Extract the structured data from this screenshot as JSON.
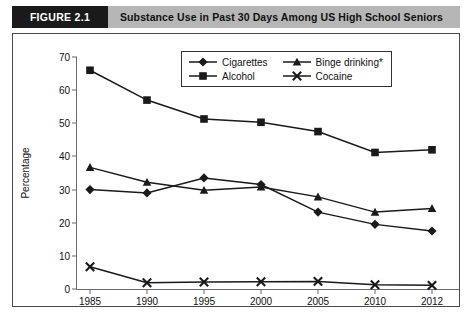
{
  "header": {
    "figure_tag": "FIGURE 2.1",
    "title": "Substance Use in Past 30 Days Among US High School Seniors"
  },
  "chart_data": {
    "type": "line",
    "title": "Substance Use in Past 30 Days Among US High School Seniors",
    "xlabel": "Years",
    "ylabel": "Percentage",
    "categories": [
      "1985",
      "1990",
      "1995",
      "2000",
      "2005",
      "2010",
      "2012"
    ],
    "ylim": [
      0,
      70
    ],
    "yticks": [
      "0",
      "10",
      "20",
      "30",
      "40",
      "50",
      "60",
      "70"
    ],
    "grid": false,
    "legend_position": "top-center-inside",
    "series": [
      {
        "name": "Cigarettes",
        "marker": "diamond",
        "values": [
          30.0,
          29.0,
          33.5,
          31.5,
          23.2,
          19.5,
          17.5
        ]
      },
      {
        "name": "Binge drinking*",
        "marker": "triangle",
        "values": [
          36.7,
          32.2,
          29.8,
          30.8,
          27.8,
          23.2,
          24.3
        ]
      },
      {
        "name": "Alcohol",
        "marker": "square",
        "values": [
          66.0,
          57.0,
          51.3,
          50.3,
          47.5,
          41.2,
          42.0
        ]
      },
      {
        "name": "Cocaine",
        "marker": "cross",
        "values": [
          6.7,
          1.9,
          2.1,
          2.2,
          2.3,
          1.3,
          1.1
        ]
      }
    ]
  },
  "colors": {
    "series_line": "#1a1a1a",
    "figure_tag_bg": "#1a1a1a",
    "header_bg": "#b6b6b6",
    "frame_border": "#4a4a4a",
    "axis": "#6b6b6b"
  }
}
